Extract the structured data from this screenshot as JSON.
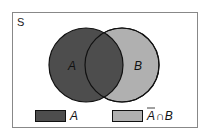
{
  "diagram": {
    "type": "venn",
    "universe_label": "S",
    "sets": [
      {
        "name": "A",
        "label": "A",
        "color": "#4d4d4d"
      },
      {
        "name": "B",
        "label": "B",
        "color": "#b0b0b0"
      }
    ],
    "legend": [
      {
        "label": "A",
        "color": "#4d4d4d"
      },
      {
        "label_bar": "A",
        "label_rest": "∩B",
        "color": "#b0b0b0"
      }
    ],
    "colors": {
      "frame": "#888888",
      "outline": "#111111",
      "background": "#ffffff"
    }
  }
}
